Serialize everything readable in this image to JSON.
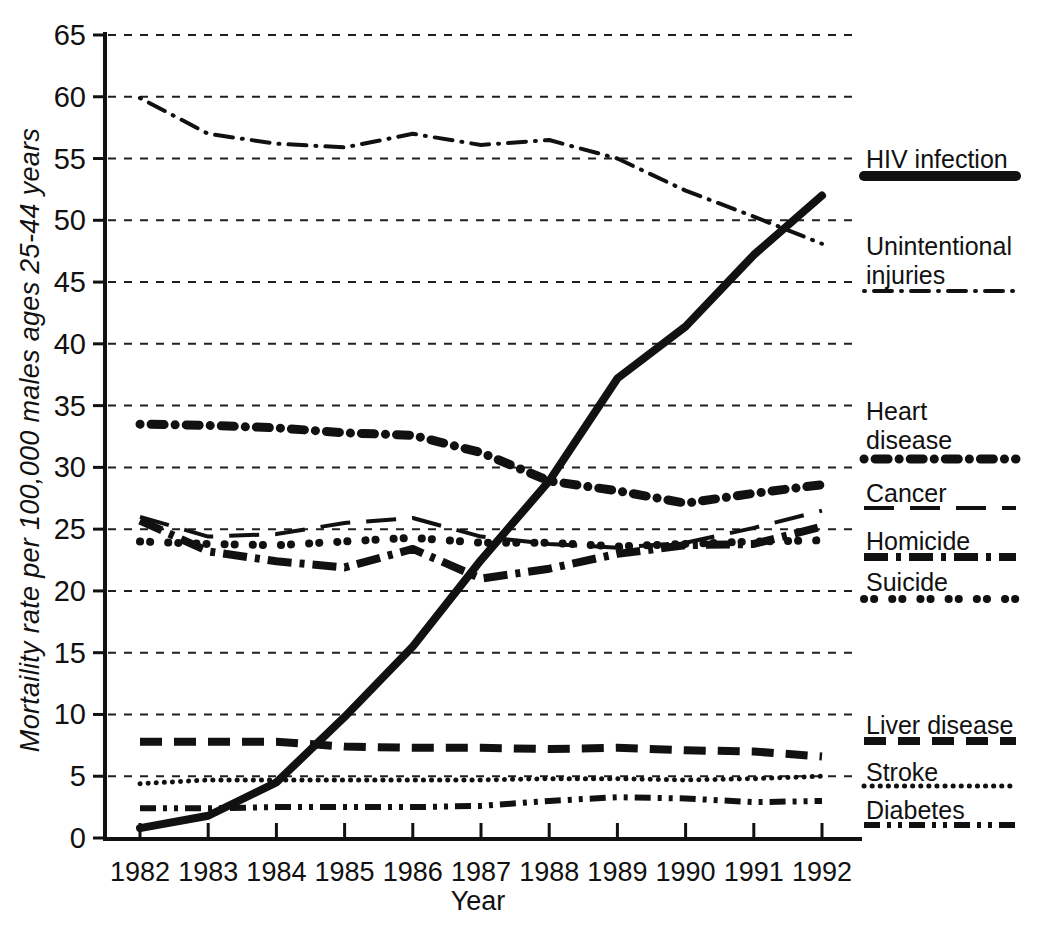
{
  "chart_data": {
    "type": "line",
    "title": "",
    "xlabel": "Year",
    "ylabel": "Mortaility rate per 100,000 males ages 25-44 years",
    "x": [
      1982,
      1983,
      1984,
      1985,
      1986,
      1987,
      1988,
      1989,
      1990,
      1991,
      1992
    ],
    "ylim": [
      0,
      65
    ],
    "y_ticks": [
      0,
      5,
      10,
      15,
      20,
      25,
      30,
      35,
      40,
      45,
      50,
      55,
      60,
      65
    ],
    "grid": "dashed horizontal gridlines every 5 units",
    "legend_position": "right",
    "ink_color": "#111111",
    "background_color": "#ffffff",
    "series": [
      {
        "key": "hiv",
        "name": "HIV infection",
        "legend_lines": [
          "HIV infection"
        ],
        "line_style": "thick solid",
        "values": [
          0.8,
          1.8,
          4.5,
          9.8,
          15.5,
          22.5,
          28.9,
          37.2,
          41.4,
          47.2,
          52.0
        ]
      },
      {
        "key": "unintentional",
        "name": "Unintentional injuries",
        "legend_lines": [
          "Unintentional",
          "injuries"
        ],
        "line_style": "dash-dot",
        "values": [
          59.9,
          57.0,
          56.2,
          55.9,
          57.0,
          56.1,
          56.5,
          55.0,
          52.4,
          50.3,
          48.1
        ]
      },
      {
        "key": "heart",
        "name": "Heart disease",
        "legend_lines": [
          "Heart",
          "disease"
        ],
        "line_style": "thick dot-dash (round dots and oval dashes)",
        "values": [
          33.5,
          33.4,
          33.2,
          32.8,
          32.6,
          31.2,
          28.9,
          28.1,
          27.1,
          27.9,
          28.6
        ]
      },
      {
        "key": "cancer",
        "name": "Cancer",
        "legend_lines": [
          "Cancer"
        ],
        "line_style": "thin long dash",
        "values": [
          26.0,
          24.4,
          24.6,
          25.5,
          25.9,
          24.4,
          23.8,
          23.5,
          23.9,
          25.1,
          26.5
        ]
      },
      {
        "key": "homicide",
        "name": "Homicide",
        "legend_lines": [
          "Homicide"
        ],
        "line_style": "thick long dash with small square dot",
        "values": [
          25.7,
          23.2,
          22.4,
          21.9,
          23.4,
          21.0,
          21.8,
          23.0,
          23.7,
          23.8,
          25.2
        ]
      },
      {
        "key": "suicide",
        "name": "Suicide",
        "legend_lines": [
          "Suicide"
        ],
        "line_style": "paired round dots",
        "values": [
          24.0,
          23.8,
          23.7,
          24.0,
          24.3,
          23.9,
          23.9,
          23.6,
          23.8,
          24.0,
          24.1
        ]
      },
      {
        "key": "liver",
        "name": "Liver disease",
        "legend_lines": [
          "Liver disease"
        ],
        "line_style": "thick dash",
        "values": [
          7.8,
          7.8,
          7.8,
          7.4,
          7.3,
          7.3,
          7.2,
          7.3,
          7.1,
          7.0,
          6.6
        ]
      },
      {
        "key": "stroke",
        "name": "Stroke",
        "legend_lines": [
          "Stroke"
        ],
        "line_style": "fine dots",
        "values": [
          4.4,
          4.7,
          4.7,
          4.7,
          4.7,
          4.7,
          4.8,
          4.8,
          4.7,
          4.8,
          5.0
        ]
      },
      {
        "key": "diabetes",
        "name": "Diabetes",
        "legend_lines": [
          "Diabetes"
        ],
        "line_style": "dash-dot-dot",
        "values": [
          2.4,
          2.4,
          2.5,
          2.5,
          2.5,
          2.6,
          3.0,
          3.3,
          3.2,
          2.9,
          3.0
        ]
      }
    ]
  }
}
